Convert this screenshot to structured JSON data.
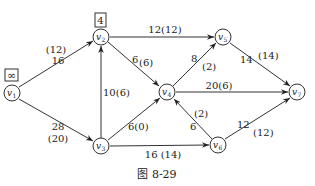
{
  "figure": {
    "caption": "图 8-29",
    "type": "network-flow-graph"
  },
  "nodes": [
    {
      "id": "v1",
      "label": "v1",
      "x": 12,
      "y": 93
    },
    {
      "id": "v2",
      "label": "v2",
      "x": 101,
      "y": 37
    },
    {
      "id": "v3",
      "label": "v3",
      "x": 101,
      "y": 146
    },
    {
      "id": "v4",
      "label": "v4",
      "x": 167,
      "y": 92
    },
    {
      "id": "v5",
      "label": "v5",
      "x": 223,
      "y": 37
    },
    {
      "id": "v6",
      "label": "v6",
      "x": 218,
      "y": 145
    },
    {
      "id": "v7",
      "label": "v7",
      "x": 297,
      "y": 92
    }
  ],
  "node_marks": [
    {
      "node": "v1",
      "text": "∞"
    },
    {
      "node": "v2",
      "text": "4"
    }
  ],
  "edges": [
    {
      "from": "v1",
      "to": "v2",
      "capacity": "16",
      "flow": "(12)"
    },
    {
      "from": "v1",
      "to": "v3",
      "capacity": "28",
      "flow": "(20)"
    },
    {
      "from": "v3",
      "to": "v2",
      "capacity": "10",
      "flow": "(6)"
    },
    {
      "from": "v2",
      "to": "v5",
      "capacity": "12",
      "flow": "(12)"
    },
    {
      "from": "v2",
      "to": "v4",
      "capacity": "6",
      "flow": "(6)"
    },
    {
      "from": "v3",
      "to": "v4",
      "capacity": "6",
      "flow": "(0)"
    },
    {
      "from": "v3",
      "to": "v6",
      "capacity": "16",
      "flow": "(14)"
    },
    {
      "from": "v4",
      "to": "v5",
      "capacity": "8",
      "flow": "(2)"
    },
    {
      "from": "v4",
      "to": "v7",
      "capacity": "20",
      "flow": "(6)"
    },
    {
      "from": "v6",
      "to": "v4",
      "capacity": "6",
      "flow": "(2)"
    },
    {
      "from": "v5",
      "to": "v7",
      "capacity": "14",
      "flow": "(14)"
    },
    {
      "from": "v6",
      "to": "v7",
      "capacity": "12",
      "flow": "(12)"
    }
  ],
  "labels": {
    "e12": {
      "cap": "16",
      "flow": "(12)"
    },
    "e13": {
      "cap": "28",
      "flow": "(20)"
    },
    "e32": {
      "text": "10(6)"
    },
    "e25": {
      "text": "12(12)"
    },
    "e24": {
      "cap": "6",
      "flow": "(6)"
    },
    "e34": {
      "text": "6(0)"
    },
    "e36": {
      "text": "16 (14)"
    },
    "e45": {
      "cap": "8",
      "flow": "(2)"
    },
    "e47": {
      "text": "20(6)"
    },
    "e64": {
      "cap": "6",
      "flow": "(2)"
    },
    "e57": {
      "cap": "14",
      "flow": "(14)"
    },
    "e67": {
      "cap": "12",
      "flow": "(12)"
    },
    "mark_v1": "∞",
    "mark_v2": "4",
    "n1": "v",
    "n1s": "1",
    "n2": "v",
    "n2s": "2",
    "n3": "v",
    "n3s": "3",
    "n4": "v",
    "n4s": "4",
    "n5": "v",
    "n5s": "5",
    "n6": "v",
    "n6s": "6",
    "n7": "v",
    "n7s": "7"
  }
}
